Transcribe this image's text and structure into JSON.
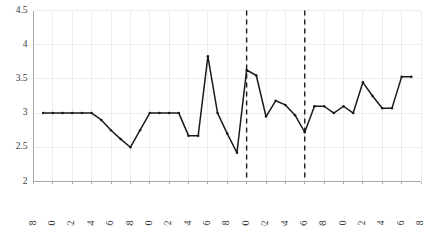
{
  "chart_data": {
    "type": "line",
    "title": "",
    "subtitle": "",
    "xlabel": "",
    "ylabel": "",
    "xlim": [
      1978,
      2018
    ],
    "ylim": [
      2,
      4.5
    ],
    "grid": true,
    "legend": "none",
    "x_ticks": [
      1978,
      1980,
      1982,
      1984,
      1986,
      1988,
      1990,
      1992,
      1994,
      1996,
      1998,
      2000,
      2002,
      2004,
      2006,
      2008,
      2010,
      2012,
      2014,
      2016,
      2018
    ],
    "y_ticks": [
      2,
      2.5,
      3,
      3.5,
      4,
      4.5
    ],
    "y_tick_labels": [
      "2",
      "2.5",
      "3",
      "3.5",
      "4",
      "4.5"
    ],
    "x": [
      1979,
      1980,
      1981,
      1982,
      1983,
      1984,
      1985,
      1986,
      1987,
      1988,
      1989,
      1990,
      1991,
      1992,
      1993,
      1994,
      1995,
      1996,
      1997,
      1998,
      1999,
      2000,
      2001,
      2002,
      2003,
      2004,
      2005,
      2006,
      2007,
      2008,
      2009,
      2010,
      2011,
      2012,
      2013,
      2014,
      2015,
      2016,
      2017
    ],
    "series": [
      {
        "name": "value",
        "color": "#1a1a1a",
        "marker": "dot",
        "values": [
          3.0,
          3.0,
          3.0,
          3.0,
          3.0,
          3.0,
          2.9,
          2.75,
          2.62,
          2.5,
          2.75,
          3.0,
          3.0,
          3.0,
          3.0,
          2.67,
          2.67,
          3.83,
          3.0,
          2.7,
          2.42,
          3.63,
          3.55,
          2.95,
          3.18,
          3.12,
          2.97,
          2.72,
          3.1,
          3.1,
          3.0,
          3.1,
          3.0,
          3.45,
          3.25,
          3.07,
          3.07,
          3.53,
          3.53
        ]
      }
    ],
    "annotations": [
      {
        "type": "vline",
        "x": 2000,
        "style": "dashed",
        "color": "#1a1a1a"
      },
      {
        "type": "vline",
        "x": 2006,
        "style": "dashed",
        "color": "#1a1a1a"
      }
    ]
  }
}
